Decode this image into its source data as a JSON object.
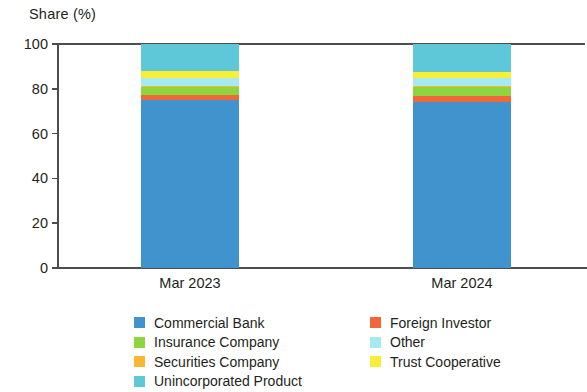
{
  "chart_data": {
    "type": "bar",
    "stacked": true,
    "stack_mode": "percent",
    "title": "",
    "ylabel": "Share (%)",
    "xlabel": "",
    "categories": [
      "Mar 2023",
      "Mar 2024"
    ],
    "ylim": [
      0,
      100
    ],
    "yticks": [
      0,
      20,
      40,
      60,
      80,
      100
    ],
    "ytick_labels": [
      "0",
      "20",
      "40",
      "60",
      "80",
      "100"
    ],
    "grid": false,
    "legend_position": "bottom",
    "series": [
      {
        "name": "Commercial Bank",
        "color": "#4093cd",
        "values": [
          74.9,
          74.1
        ]
      },
      {
        "name": "Foreign Investor",
        "color": "#f2663c",
        "values": [
          2.2,
          2.7
        ]
      },
      {
        "name": "Insurance Company",
        "color": "#8ed63f",
        "values": [
          3.6,
          4.0
        ]
      },
      {
        "name": "Securities Company",
        "color": "#f7b733",
        "values": [
          0.4,
          0.4
        ]
      },
      {
        "name": "Other",
        "color": "#a6eaf0",
        "values": [
          3.6,
          3.6
        ]
      },
      {
        "name": "Trust Cooperative",
        "color": "#f9ee36",
        "values": [
          3.1,
          2.7
        ]
      },
      {
        "name": "Unincorporated Product",
        "color": "#5ec8d8",
        "values": [
          12.2,
          12.5
        ]
      }
    ]
  },
  "legend": {
    "left_column": [
      {
        "label": "Commercial Bank",
        "color": "#4093cd"
      },
      {
        "label": "Insurance Company",
        "color": "#8ed63f"
      },
      {
        "label": "Securities Company",
        "color": "#f7b733"
      },
      {
        "label": "Unincorporated Product",
        "color": "#5ec8d8"
      }
    ],
    "right_column": [
      {
        "label": "Foreign Investor",
        "color": "#f2663c"
      },
      {
        "label": "Other",
        "color": "#a6eaf0"
      },
      {
        "label": "Trust Cooperative",
        "color": "#f9ee36"
      }
    ]
  }
}
